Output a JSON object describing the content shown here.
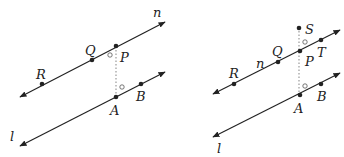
{
  "figures": [
    {
      "id": "left",
      "lines": [
        {
          "name": "n",
          "x1": 20,
          "y1": 97,
          "x2": 165,
          "y2": 22
        },
        {
          "name": "l",
          "x1": 20,
          "y1": 146,
          "x2": 165,
          "y2": 72
        }
      ],
      "points": [
        {
          "name": "R",
          "x": 42,
          "y": 84,
          "lx": 36,
          "ly": 79
        },
        {
          "name": "Q",
          "x": 92,
          "y": 60,
          "lx": 85,
          "ly": 55
        },
        {
          "name": "P",
          "x": 116,
          "y": 46,
          "lx": 120,
          "ly": 62
        },
        {
          "name": "A",
          "x": 116,
          "y": 97,
          "lx": 110,
          "ly": 115
        },
        {
          "name": "B",
          "x": 141,
          "y": 84,
          "lx": 136,
          "ly": 101
        }
      ],
      "line_labels": [
        {
          "name": "n",
          "x": 153,
          "y": 17
        },
        {
          "name": "l",
          "x": 10,
          "y": 141
        }
      ],
      "dotted": {
        "x1": 116,
        "y1": 50,
        "x2": 116,
        "y2": 94
      },
      "right_angle_marks": [
        {
          "x": 110,
          "y": 55
        },
        {
          "x": 122,
          "y": 87
        }
      ]
    },
    {
      "id": "right",
      "lines": [
        {
          "name": "n",
          "x1": 213,
          "y1": 94,
          "x2": 340,
          "y2": 30
        },
        {
          "name": "l",
          "x1": 213,
          "y1": 137,
          "x2": 340,
          "y2": 73
        }
      ],
      "points": [
        {
          "name": "R",
          "x": 234,
          "y": 84,
          "lx": 229,
          "ly": 78
        },
        {
          "name": "Q",
          "x": 278,
          "y": 62,
          "lx": 272,
          "ly": 56
        },
        {
          "name": "P",
          "x": 300,
          "y": 51,
          "lx": 305,
          "ly": 66
        },
        {
          "name": "T",
          "x": 321,
          "y": 40,
          "lx": 317,
          "ly": 57
        },
        {
          "name": "S",
          "x": 299,
          "y": 28,
          "lx": 305,
          "ly": 34
        },
        {
          "name": "A",
          "x": 300,
          "y": 95,
          "lx": 294,
          "ly": 113
        },
        {
          "name": "B",
          "x": 321,
          "y": 84,
          "lx": 317,
          "ly": 101
        }
      ],
      "line_labels": [
        {
          "name": "n",
          "x": 256,
          "y": 68
        },
        {
          "name": "l",
          "x": 217,
          "y": 153
        }
      ],
      "dotted": {
        "x1": 299,
        "y1": 31,
        "x2": 299,
        "y2": 93
      },
      "right_angle_marks": [
        {
          "x": 305,
          "y": 42
        },
        {
          "x": 305,
          "y": 86
        }
      ]
    }
  ],
  "colors": {
    "stroke": "#222222",
    "dotted": "#999999"
  }
}
